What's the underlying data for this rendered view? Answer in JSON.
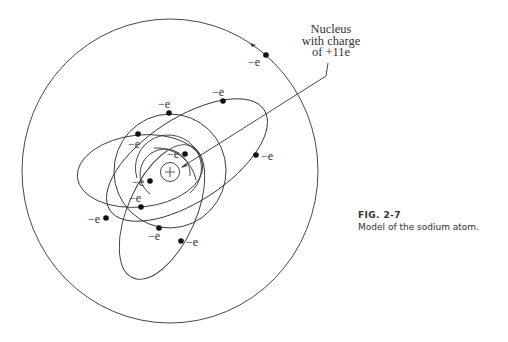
{
  "figure": {
    "number": "FIG. 2-7",
    "caption": "Model of the sodium atom."
  },
  "nucleus_label": {
    "line1": "Nucleus",
    "line2": "with charge",
    "line3": "of +11e"
  },
  "nucleus_symbol": "+",
  "electron_label": "−e",
  "electron_count": 11,
  "electrons": [
    {
      "id": 1,
      "label": "−e",
      "shell": "inner"
    },
    {
      "id": 2,
      "label": "−e",
      "shell": "inner"
    },
    {
      "id": 3,
      "label": "−e",
      "shell": "middle"
    },
    {
      "id": 4,
      "label": "−e",
      "shell": "middle"
    },
    {
      "id": 5,
      "label": "−e",
      "shell": "middle"
    },
    {
      "id": 6,
      "label": "−e",
      "shell": "middle"
    },
    {
      "id": 7,
      "label": "−e",
      "shell": "middle"
    },
    {
      "id": 8,
      "label": "−e",
      "shell": "middle"
    },
    {
      "id": 9,
      "label": "−e",
      "shell": "middle"
    },
    {
      "id": 10,
      "label": "−e",
      "shell": "middle"
    },
    {
      "id": 11,
      "label": "−e",
      "shell": "outer"
    }
  ],
  "colors": {
    "line": "#333333",
    "background": "#ffffff"
  }
}
